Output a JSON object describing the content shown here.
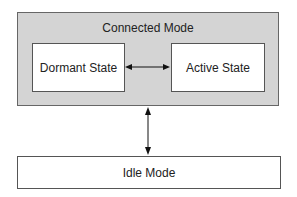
{
  "diagram": {
    "outer": {
      "label": "Connected Mode",
      "fill": "#d4d4d4"
    },
    "states": [
      {
        "id": "dormant",
        "label": "Dormant State"
      },
      {
        "id": "active",
        "label": "Active State"
      }
    ],
    "idle": {
      "label": "Idle Mode"
    },
    "edges": [
      {
        "from": "Dormant State",
        "to": "Active State",
        "type": "bidirectional"
      },
      {
        "from": "Connected Mode",
        "to": "Idle Mode",
        "type": "bidirectional"
      }
    ]
  }
}
